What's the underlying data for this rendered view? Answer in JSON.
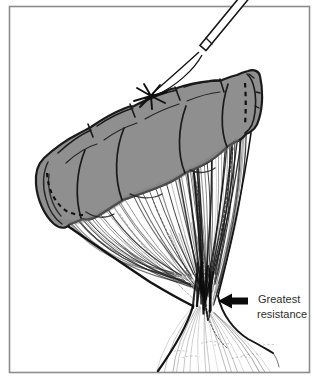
{
  "figure": {
    "type": "surgical-line-illustration",
    "label": {
      "line1": "Greatest",
      "line2": "resistance"
    },
    "arrow": {
      "direction": "left"
    },
    "colors": {
      "background": "#ffffff",
      "frame": "#8c8c8c",
      "bowel_fill": "#8f8f8f",
      "bowel_shade": "#7d7d7d",
      "outline": "#1a1a1a",
      "hatch": "#222222",
      "arrow": "#0b0b0b",
      "label_text": "#2d2d2d"
    }
  }
}
